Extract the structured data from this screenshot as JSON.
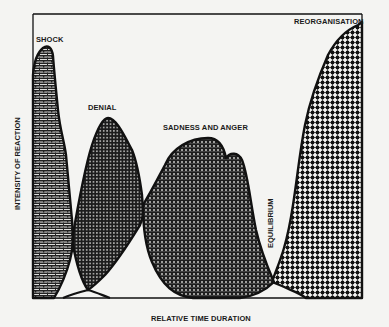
{
  "figure": {
    "type": "stage-curves",
    "axes": {
      "x_label": "RELATIVE TIME DURATION",
      "y_label": "INTENSITY OF REACTION"
    },
    "stages": [
      {
        "id": "shock",
        "label": "SHOCK",
        "order": 1,
        "pattern": "brick",
        "peak": "highest early"
      },
      {
        "id": "denial",
        "label": "DENIAL",
        "order": 2,
        "pattern": "dense-dots-dark",
        "peak": "medium"
      },
      {
        "id": "sadness-anger",
        "label": "SADNESS AND ANGER",
        "order": 3,
        "pattern": "grid-dots",
        "peak": "medium, double hump"
      },
      {
        "id": "equilibrium",
        "label": "EQUILIBRIUM",
        "order": 4,
        "pattern": "none",
        "peak": "lowest point (trough)"
      },
      {
        "id": "reorganisation",
        "label": "REORGANISATION",
        "order": 5,
        "pattern": "checker-dots",
        "peak": "highest, late"
      }
    ]
  },
  "colors": {
    "background": "#f4f4f2",
    "ink": "#111111",
    "fill_light": "#f4f4f2"
  }
}
